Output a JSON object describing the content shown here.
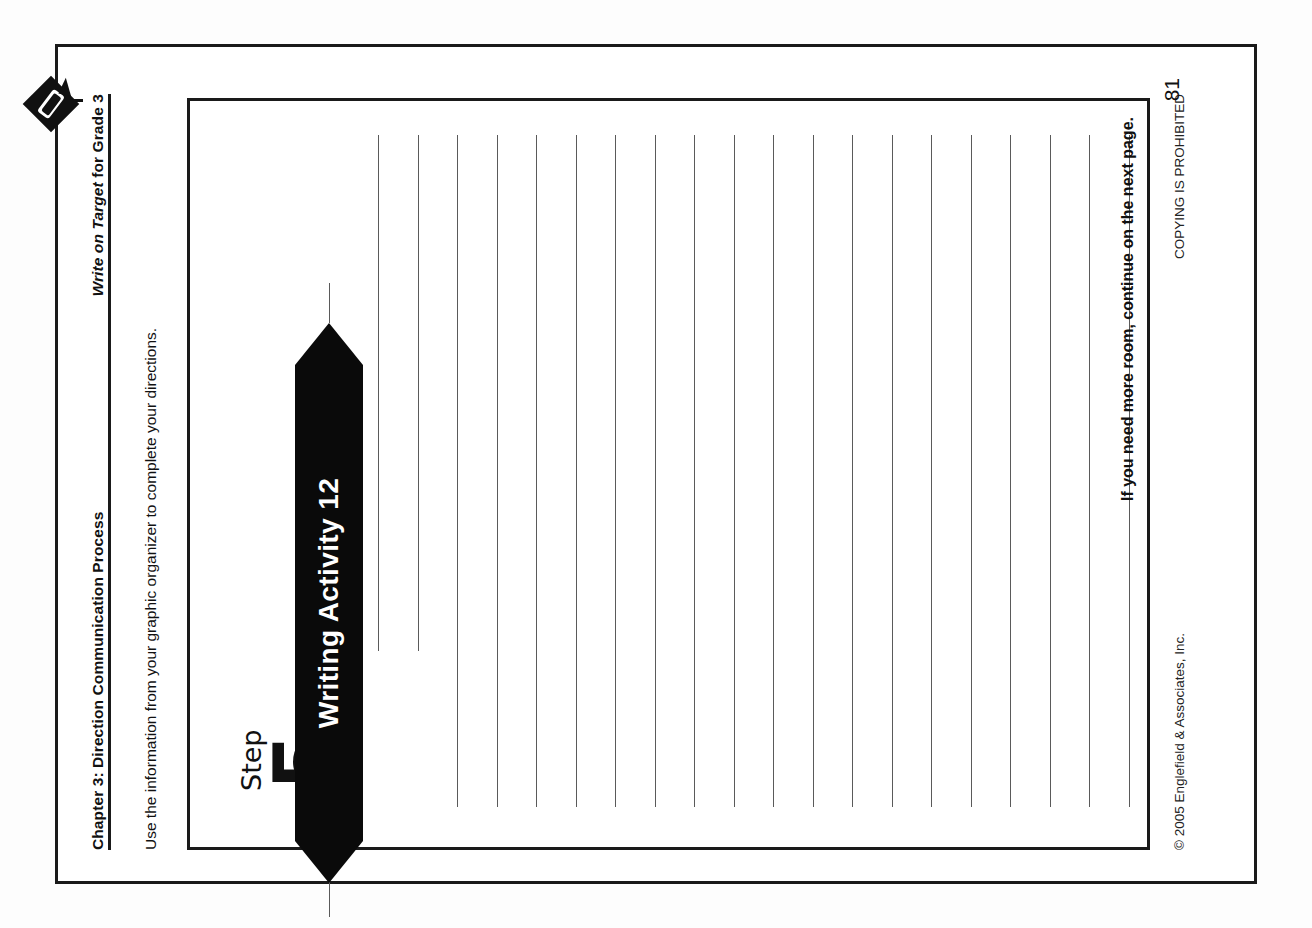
{
  "document": {
    "page_number": "81",
    "orientation": "rotated-90-ccw"
  },
  "header": {
    "chapter": "Chapter 3: Direction Communication Process",
    "book_title_prefix": "Write on Target",
    "book_title_suffix": " for Grade 3",
    "logo_icon": "diamond-pencil-logo-icon"
  },
  "instruction": {
    "text": "Use the information from your graphic organizer to complete your directions."
  },
  "activity": {
    "banner_label": "Writing Activity 12",
    "step_word": "Step",
    "step_number": "5",
    "continue_note": "If you need more room, continue on the next page.",
    "writing_lines_count": 20
  },
  "footer": {
    "copyright": "© 2005 Englefield & Associates, Inc.",
    "notice": "COPYING IS PROHIBITED"
  },
  "colors": {
    "ink": "#1a1a1a",
    "banner_bg": "#0a0a0a",
    "banner_text": "#ffffff",
    "rule_line": "#5a5a5a",
    "paper": "#ffffff"
  }
}
